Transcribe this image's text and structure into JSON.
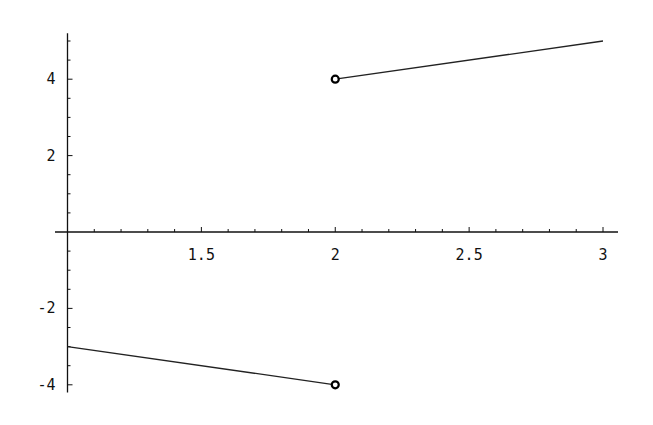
{
  "chart_data": {
    "type": "line",
    "title": "",
    "xlabel": "",
    "ylabel": "",
    "xlim": [
      1.0,
      3.05
    ],
    "ylim": [
      -4.2,
      5.2
    ],
    "grid": false,
    "x_ticks": [
      1.5,
      2,
      2.5,
      3
    ],
    "x_tick_labels": [
      "1.5",
      "2",
      "2.5",
      "3"
    ],
    "y_ticks": [
      -4,
      -2,
      2,
      4
    ],
    "y_tick_labels": [
      "-4",
      "-2",
      "2",
      "4"
    ],
    "series": [
      {
        "name": "left piece",
        "x": [
          1.0,
          2.0
        ],
        "y": [
          -3.0,
          -4.0
        ],
        "end_marker": "open-circle"
      },
      {
        "name": "right piece",
        "x": [
          2.0,
          3.0
        ],
        "y": [
          4.0,
          5.0
        ],
        "start_marker": "open-circle"
      }
    ],
    "colors": {
      "line": "#222222",
      "axis": "#111111",
      "background": "#ffffff"
    }
  }
}
